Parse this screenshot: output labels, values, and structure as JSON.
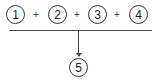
{
  "diagram": {
    "inputs": [
      {
        "label": "1"
      },
      {
        "label": "2"
      },
      {
        "label": "3"
      },
      {
        "label": "4"
      }
    ],
    "operators": [
      "+",
      "+",
      "+"
    ],
    "output": {
      "label": "5"
    },
    "colors": {
      "stroke": "#333333",
      "background": "#ffffff"
    }
  }
}
